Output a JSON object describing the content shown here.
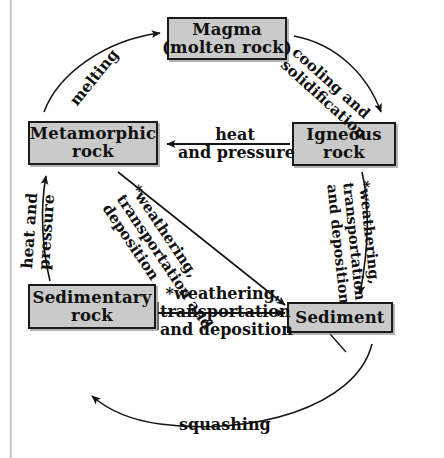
{
  "diagram": {
    "type": "cycle-diagram",
    "nodes": [
      {
        "id": "magma",
        "lines": [
          "Magma",
          "(molten rock)"
        ]
      },
      {
        "id": "metamorphic",
        "lines": [
          "Metamorphic",
          "rock"
        ]
      },
      {
        "id": "igneous",
        "lines": [
          "Igneous",
          "rock"
        ]
      },
      {
        "id": "sedimentary",
        "lines": [
          "Sedimentary",
          "rock"
        ]
      },
      {
        "id": "sediment",
        "lines": [
          "Sediment"
        ]
      }
    ],
    "edges": [
      {
        "id": "cooling",
        "from": "magma",
        "to": "igneous",
        "lines": [
          "cooling and",
          "solidification"
        ]
      },
      {
        "id": "melting",
        "from": "metamorphic",
        "to": "magma",
        "lines": [
          "melting"
        ]
      },
      {
        "id": "heat-pressure-top",
        "from": "igneous",
        "to": "metamorphic",
        "lines": [
          "heat",
          "and pressure"
        ]
      },
      {
        "id": "weathering-diagonal",
        "from": "metamorphic",
        "to": "sediment",
        "lines": [
          "*weathering,",
          "transportation and",
          "deposition"
        ]
      },
      {
        "id": "weathering-right",
        "from": "igneous",
        "to": "sediment",
        "lines": [
          "*weathering,",
          "transportation",
          "and deposition"
        ]
      },
      {
        "id": "heat-pressure-left",
        "from": "sedimentary",
        "to": "metamorphic",
        "lines": [
          "heat and",
          "pressure"
        ]
      },
      {
        "id": "weathering-bottom",
        "from": "sedimentary",
        "to": "sediment",
        "lines": [
          "*weathering,",
          "transportation",
          "and deposition"
        ]
      },
      {
        "id": "squashing",
        "from": "sediment",
        "to": "sedimentary",
        "lines": [
          "squashing"
        ]
      }
    ]
  },
  "colors": {
    "box_fill": "#cacaca",
    "box_border": "#1a1a1a",
    "text": "#101010",
    "arrow": "#141414",
    "page_background": "#ffffff",
    "edge_rule": "#c0c0c0"
  }
}
